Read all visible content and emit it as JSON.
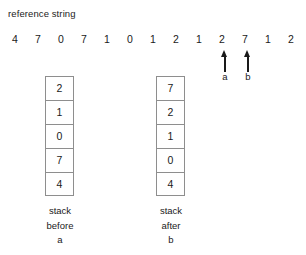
{
  "figure": {
    "background_color": "#ffffff",
    "ink_color": "#1a1a1a",
    "box_border_color": "#8e8e8e"
  },
  "reference_string": {
    "title": "reference string",
    "values": [
      "4",
      "7",
      "0",
      "7",
      "1",
      "0",
      "1",
      "2",
      "1",
      "2",
      "7",
      "1",
      "2"
    ]
  },
  "markers": [
    {
      "label": "a",
      "icon": "up-arrow-icon",
      "after_index": 9
    },
    {
      "label": "b",
      "icon": "up-arrow-icon",
      "after_index": 10
    }
  ],
  "stacks": [
    {
      "id": "stack-before-a",
      "cells": [
        "2",
        "1",
        "0",
        "7",
        "4"
      ],
      "caption_line1": "stack",
      "caption_line2": "before",
      "caption_line3": "a"
    },
    {
      "id": "stack-after-b",
      "cells": [
        "7",
        "2",
        "1",
        "0",
        "4"
      ],
      "caption_line1": "stack",
      "caption_line2": "after",
      "caption_line3": "b"
    }
  ]
}
